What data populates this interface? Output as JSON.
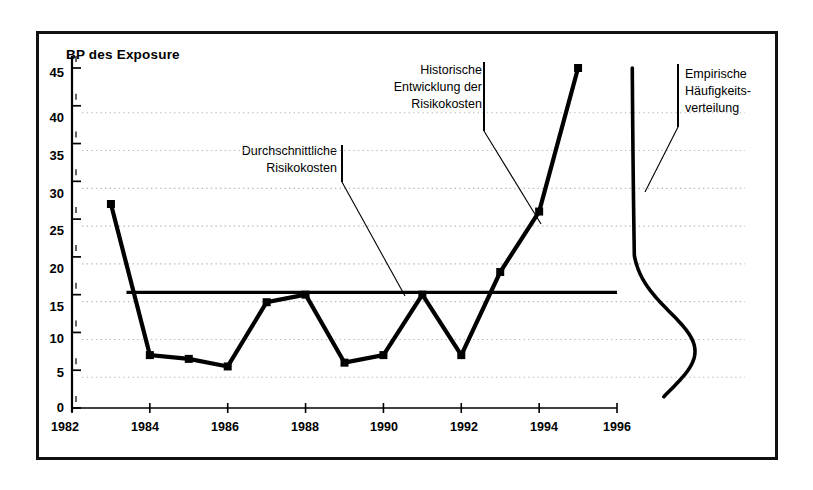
{
  "chart_data": {
    "type": "line",
    "title": "BP des Exposure",
    "xlabel": "",
    "ylabel": "BP des Exposure",
    "xlim": [
      1982,
      1996
    ],
    "ylim": [
      0,
      45
    ],
    "grid": true,
    "legend_position": "none",
    "x_ticks": [
      "1982",
      "1984",
      "1986",
      "1988",
      "1990",
      "1992",
      "1994",
      "1996"
    ],
    "x_tick_values": [
      1982,
      1984,
      1986,
      1988,
      1990,
      1992,
      1994,
      1996
    ],
    "y_ticks": [
      "0",
      "5",
      "10",
      "15",
      "20",
      "25",
      "30",
      "35",
      "40",
      "45"
    ],
    "y_tick_values": [
      0,
      5,
      10,
      15,
      20,
      25,
      30,
      35,
      40,
      45
    ],
    "series": [
      {
        "name": "Historische Entwicklung der Risikokosten",
        "type": "line",
        "marker": "square",
        "x": [
          1983,
          1984,
          1985,
          1986,
          1987,
          1988,
          1989,
          1990,
          1991,
          1992,
          1993,
          1994,
          1995
        ],
        "values": [
          27,
          7,
          6.5,
          5.5,
          14,
          15,
          6,
          7,
          15,
          7,
          18,
          26,
          45
        ]
      },
      {
        "name": "Durchschnittliche Risikokosten",
        "type": "hline",
        "marker": "none",
        "x": [
          1983.4,
          1996
        ],
        "values": [
          15.3,
          15.3
        ]
      },
      {
        "name": "Empirische Häufigkeitsverteilung",
        "type": "density-curve",
        "marker": "none",
        "orientation": "vertical",
        "peak_y": 7.5,
        "y_range": [
          1.5,
          45
        ]
      }
    ],
    "annotations": [
      {
        "id": "durchschnittliche-risikokosten",
        "lines": [
          "Durchschnittliche",
          "Risikokosten"
        ],
        "align": "right"
      },
      {
        "id": "historische-entwicklung",
        "lines": [
          "Historische",
          "Entwicklung der",
          "Risikokosten"
        ],
        "align": "right"
      },
      {
        "id": "empirische-haeufigkeitsverteilung",
        "lines": [
          "Empirische",
          "Häufigkeits-",
          "verteilung"
        ],
        "align": "left"
      }
    ],
    "colors": {
      "line": "#000000",
      "grid": "#b8b8b8",
      "axis": "#000000",
      "frame": "#111111",
      "background": "#ffffff"
    }
  }
}
